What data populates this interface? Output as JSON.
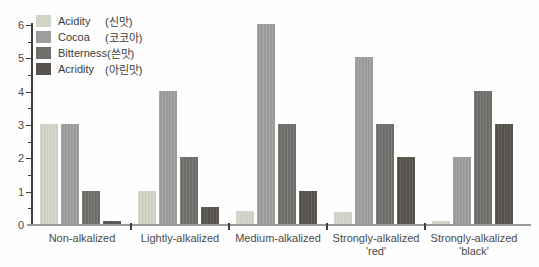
{
  "chart_data": {
    "type": "bar",
    "title": "",
    "categories": [
      {
        "line1": "Non-alkalized",
        "line2": ""
      },
      {
        "line1": "Lightly-alkalized",
        "line2": ""
      },
      {
        "line1": "Medium-alkalized",
        "line2": ""
      },
      {
        "line1": "Strongly-alkalized",
        "line2": "'red'"
      },
      {
        "line1": "Strongly-alkalized",
        "line2": "'black'"
      }
    ],
    "series": [
      {
        "name": "Acidity",
        "korean": "(신맛)",
        "color": "#d0d5c7",
        "values": [
          3,
          1,
          0.4,
          0.35,
          0.1
        ]
      },
      {
        "name": "Cocoa",
        "korean": "(코코아)",
        "color": "#9d9d9b",
        "values": [
          3,
          4,
          6,
          5,
          2
        ]
      },
      {
        "name": "Bitterness",
        "korean": "(쓴맛)",
        "color": "#6e6e6b",
        "values": [
          1,
          2,
          3,
          3,
          4
        ]
      },
      {
        "name": "Acridity",
        "korean": "(아린맛)",
        "color": "#56524c",
        "values": [
          0.1,
          0.5,
          1,
          2,
          3
        ]
      }
    ],
    "xlabel": "",
    "ylabel": "",
    "ylim": [
      0,
      6
    ],
    "yticks": [
      0,
      1,
      2,
      3,
      4,
      5,
      6
    ],
    "minor_tick_step": 0.5,
    "legend_position": "top-left",
    "grid": false,
    "axis_color": "#3d3d3d",
    "x_axis_color": "#9a9a9a",
    "text_color": "#4a4a4a"
  }
}
